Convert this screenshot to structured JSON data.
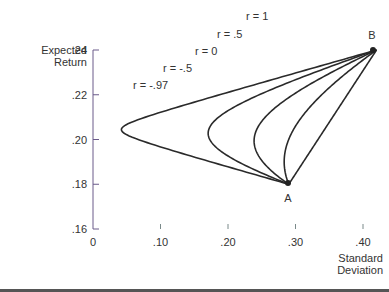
{
  "chart_data": {
    "type": "line",
    "title": "",
    "xlabel": "Standard Deviation",
    "ylabel": "Expected Return",
    "xlim": [
      0,
      0.42
    ],
    "ylim": [
      0.16,
      0.24
    ],
    "x_ticks": [
      "0",
      ".10",
      ".20",
      ".30",
      ".40"
    ],
    "x_tick_values": [
      0,
      0.1,
      0.2,
      0.3,
      0.4
    ],
    "y_ticks": [
      ".16",
      ".18",
      ".20",
      ".22",
      ".24"
    ],
    "y_tick_values": [
      0.16,
      0.18,
      0.2,
      0.22,
      0.24
    ],
    "grid": false,
    "points": [
      {
        "label": "A",
        "sd": 0.29,
        "return": 0.18
      },
      {
        "label": "B",
        "sd": 0.42,
        "return": 0.24
      }
    ],
    "series": [
      {
        "name": "r = 1",
        "correlation": 1
      },
      {
        "name": "r = .5",
        "correlation": 0.5
      },
      {
        "name": "r = 0",
        "correlation": 0
      },
      {
        "name": "r = -.5",
        "correlation": -0.5
      },
      {
        "name": "r = -.97",
        "correlation": -0.97
      }
    ],
    "annotations": [
      "r = 1",
      "r = .5",
      "r = 0",
      "r = -.5",
      "r = -.97",
      "A",
      "B"
    ]
  },
  "labels": {
    "ylabel_line1": "Expected",
    "ylabel_line2": "Return",
    "xlabel_line1": "Standard",
    "xlabel_line2": "Deviation"
  },
  "colors": {
    "curve": "#2a2a2a",
    "axis_y": "#6a5a8a",
    "axis_x_left": "#8a6ab0",
    "axis_x_right": "#7aa07a",
    "text": "#333333"
  }
}
